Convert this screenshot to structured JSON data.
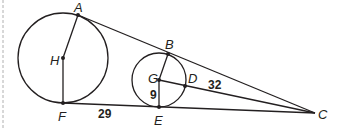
{
  "diagram": {
    "points": {
      "A": "A",
      "H": "H",
      "F": "F",
      "B": "B",
      "G": "G",
      "D": "D",
      "E": "E",
      "C": "C"
    },
    "measures": {
      "FE": "29",
      "GE": "9",
      "DC": "32"
    },
    "colors": {
      "stroke": "#231f20",
      "margin_dash": "#b0b0b0"
    }
  }
}
